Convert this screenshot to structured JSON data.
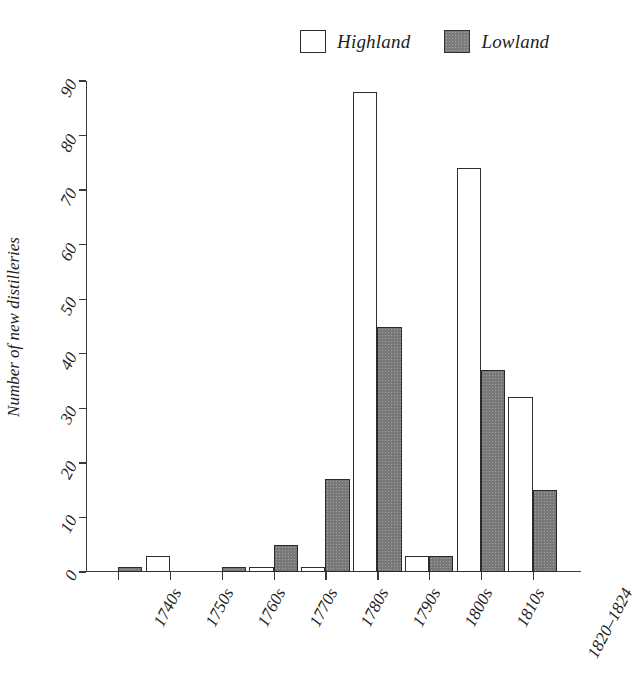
{
  "legend": {
    "position": "top-center",
    "items": [
      {
        "label": "Highland",
        "swatch": "open-square",
        "color": "#ffffff"
      },
      {
        "label": "Lowland",
        "swatch": "filled-square",
        "color": "#787878"
      }
    ]
  },
  "axes": {
    "ylabel": "Number of new distilleries",
    "xlabel": "",
    "yticks": [
      0,
      10,
      20,
      30,
      40,
      50,
      60,
      70,
      80,
      90
    ],
    "ylim": [
      0,
      90
    ],
    "grid": false
  },
  "chart_data": {
    "type": "bar",
    "title": "",
    "subtitle": "",
    "xlabel": "",
    "ylabel": "Number of new distilleries",
    "ylim": [
      0,
      90
    ],
    "yticks": [
      0,
      10,
      20,
      30,
      40,
      50,
      60,
      70,
      80,
      90
    ],
    "grid": false,
    "legend_position": "top-center",
    "categories": [
      "1740s",
      "1750s",
      "1760s",
      "1770s",
      "1780s",
      "1790s",
      "1800s",
      "1810s",
      "1820–1824"
    ],
    "series": [
      {
        "name": "Highland",
        "color": "#ffffff",
        "values": [
          0,
          3,
          0,
          1,
          1,
          88,
          3,
          74,
          32
        ]
      },
      {
        "name": "Lowland",
        "color": "#787878",
        "values": [
          1,
          0,
          1,
          5,
          17,
          45,
          3,
          37,
          15
        ]
      }
    ]
  }
}
